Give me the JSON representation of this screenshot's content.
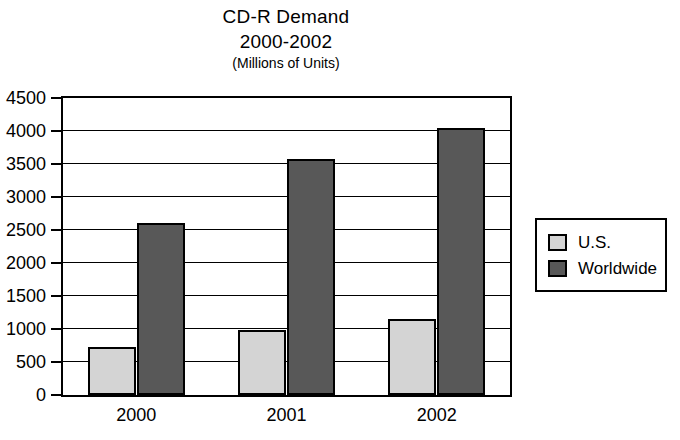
{
  "chart_data": {
    "type": "bar",
    "title": "CD-R Demand",
    "subtitle": "2000-2002",
    "units_note": "(Millions of Units)",
    "xlabel": "",
    "ylabel": "",
    "categories": [
      "2000",
      "2001",
      "2002"
    ],
    "series": [
      {
        "name": "U.S.",
        "values": [
          730,
          980,
          1150
        ],
        "color": "#d4d4d4"
      },
      {
        "name": "Worldwide",
        "values": [
          2610,
          3570,
          4050
        ],
        "color": "#585858"
      }
    ],
    "ylim": [
      0,
      4500
    ],
    "ytick_values": [
      0,
      500,
      1000,
      1500,
      2000,
      2500,
      3000,
      3500,
      4000,
      4500
    ],
    "ytick_labels": [
      "0",
      "500",
      "1000",
      "1500",
      "2000",
      "2500",
      "3000",
      "3500",
      "4000",
      "4500"
    ],
    "grid": true,
    "grid_axis": "y",
    "legend_position": "right",
    "legend_entries": [
      "U.S.",
      "Worldwide"
    ],
    "frame_color": "#000000",
    "background_color": "#ffffff"
  }
}
